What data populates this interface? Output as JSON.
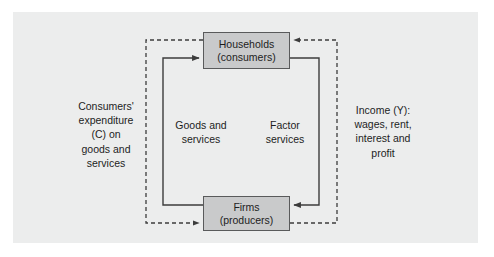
{
  "diagram": {
    "background_color": "#eceded",
    "page_color": "#ffffff",
    "box_fill": "#c9cacb",
    "box_border": "#595a5b",
    "line_color": "#3c3c3c",
    "nodes": [
      {
        "id": "households",
        "line1": "Households",
        "line2": "(consumers)"
      },
      {
        "id": "firms",
        "line1": "Firms",
        "line2": "(producers)"
      }
    ],
    "flows": [
      {
        "id": "expenditure",
        "style": "dashed",
        "lines": [
          "Consumers'",
          "expenditure",
          "(C) on",
          "goods and",
          "services"
        ]
      },
      {
        "id": "income",
        "style": "dashed",
        "lines": [
          "Income (Y):",
          "wages, rent,",
          "interest and",
          "profit"
        ]
      },
      {
        "id": "goods-and-services",
        "style": "solid",
        "lines": [
          "Goods and",
          "services"
        ]
      },
      {
        "id": "factor-services",
        "style": "solid",
        "lines": [
          "Factor",
          "services"
        ]
      }
    ]
  }
}
